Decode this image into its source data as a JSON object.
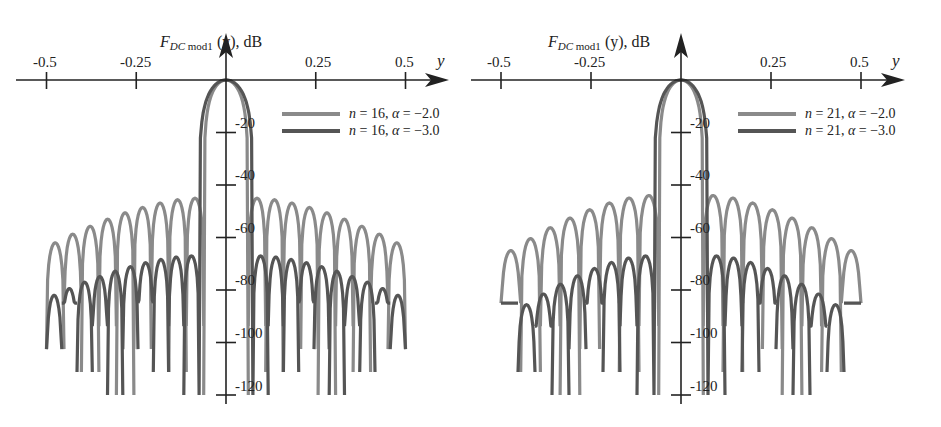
{
  "chart_data": [
    {
      "type": "line",
      "title": "",
      "ylabel_main": "F",
      "ylabel_sub": "DC mod1",
      "ylabel_rest": " (y), dB",
      "xlabel": "y",
      "x_ticks": [
        "-0.5",
        "-0.25",
        "0.25",
        "0.5"
      ],
      "x_tick_values": [
        -0.5,
        -0.25,
        0.25,
        0.5
      ],
      "y_ticks": [
        "-20",
        "-40",
        "-60",
        "-80",
        "-100",
        "-120"
      ],
      "y_tick_values": [
        -20,
        -40,
        -60,
        -80,
        -100,
        -120
      ],
      "xlim": [
        -0.5,
        0.5
      ],
      "ylim": [
        -120,
        0
      ],
      "grid": false,
      "legend_position": "upper right",
      "series": [
        {
          "name": "n = 16, α = −2.0",
          "n": 16,
          "alpha": -2.0,
          "color": "#8a8a8a",
          "main_lobe_peak_db": 0,
          "first_null_y": 0.062,
          "sidelobe_peaks_db_near": -45,
          "sidelobe_peaks_db_edge": -62,
          "null_depth_db": -120
        },
        {
          "name": "n = 16, α = −3.0",
          "n": 16,
          "alpha": -3.0,
          "color": "#555555",
          "main_lobe_peak_db": 0,
          "first_null_y": 0.075,
          "sidelobe_peaks_db_near": -67,
          "sidelobe_peaks_db_edge": -82,
          "null_depth_db": -120
        }
      ]
    },
    {
      "type": "line",
      "title": "",
      "ylabel_main": "F",
      "ylabel_sub": "DC mod1",
      "ylabel_rest": " (y), dB",
      "xlabel": "y",
      "x_ticks": [
        "-0.5",
        "-0.25",
        "0.25",
        "0.5"
      ],
      "x_tick_values": [
        -0.5,
        -0.25,
        0.25,
        0.5
      ],
      "y_ticks": [
        "-20",
        "-40",
        "-60",
        "-80",
        "-100",
        "-120"
      ],
      "y_tick_values": [
        -20,
        -40,
        -60,
        -80,
        -100,
        -120
      ],
      "xlim": [
        -0.5,
        0.5
      ],
      "ylim": [
        -120,
        0
      ],
      "grid": false,
      "legend_position": "upper right",
      "series": [
        {
          "name": "n = 21, α = −2.0",
          "n": 21,
          "alpha": -2.0,
          "color": "#8a8a8a",
          "main_lobe_peak_db": 0,
          "first_null_y": 0.062,
          "sidelobe_peaks_db_near": -44,
          "sidelobe_peaks_db_edge": -65,
          "null_depth_db": -120
        },
        {
          "name": "n = 21, α = −3.0",
          "n": 21,
          "alpha": -3.0,
          "color": "#555555",
          "main_lobe_peak_db": 0,
          "first_null_y": 0.075,
          "sidelobe_peaks_db_near": -67,
          "sidelobe_peaks_db_edge": -90,
          "null_depth_db": -120
        }
      ]
    }
  ],
  "panels": [
    {
      "legend": [
        {
          "n_label": "n",
          "n_value": " = 16, ",
          "a_label": "α",
          "a_value": " = −2.0"
        },
        {
          "n_label": "n",
          "n_value": " = 16, ",
          "a_label": "α",
          "a_value": " = −3.0"
        }
      ]
    },
    {
      "legend": [
        {
          "n_label": "n",
          "n_value": " = 21, ",
          "a_label": "α",
          "a_value": " = −2.0"
        },
        {
          "n_label": "n",
          "n_value": " = 21, ",
          "a_label": "α",
          "a_value": " = −3.0"
        }
      ]
    }
  ]
}
